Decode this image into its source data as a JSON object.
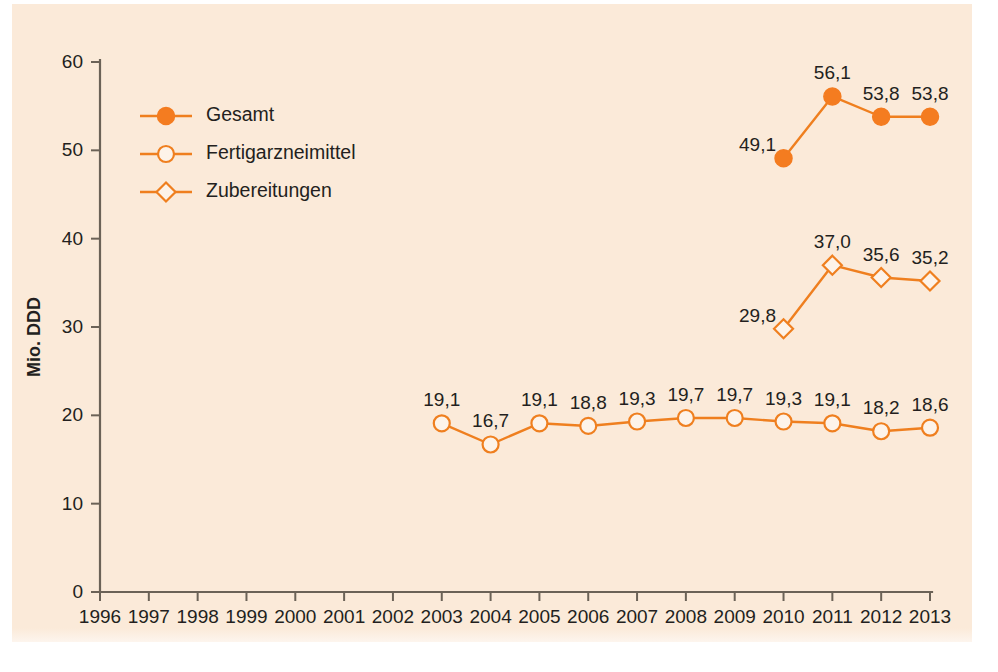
{
  "chart_data": {
    "type": "line",
    "title": "",
    "xlabel": "",
    "ylabel": "Mio. DDD",
    "x": [
      1996,
      1997,
      1998,
      1999,
      2000,
      2001,
      2002,
      2003,
      2004,
      2005,
      2006,
      2007,
      2008,
      2009,
      2010,
      2011,
      2012,
      2013
    ],
    "xtick_labels": [
      "1996",
      "1997",
      "1998",
      "1999",
      "2000",
      "2001",
      "2002",
      "2003",
      "2004",
      "2005",
      "2006",
      "2007",
      "2008",
      "2009",
      "2010",
      "2011",
      "2012",
      "2013"
    ],
    "ylim": [
      0,
      60
    ],
    "yticks": [
      0,
      10,
      20,
      30,
      40,
      50,
      60
    ],
    "ytick_labels": [
      "0",
      "10",
      "20",
      "30",
      "40",
      "50",
      "60"
    ],
    "grid": false,
    "legend_position": "upper-left-inside",
    "accent_color": "#ef7f1f",
    "background_color": "#fbead9",
    "series": [
      {
        "name": "Gesamt",
        "marker": "filled-circle",
        "color": "#f47c20",
        "x": [
          2010,
          2011,
          2012,
          2013
        ],
        "values": [
          49.1,
          56.1,
          53.8,
          53.8
        ],
        "labels": [
          "49,1",
          "56,1",
          "53,8",
          "53,8"
        ],
        "label_positions": [
          "left",
          "above",
          "above",
          "above"
        ]
      },
      {
        "name": "Fertigarzneimittel",
        "marker": "open-circle",
        "color": "#ef7f1f",
        "x": [
          2003,
          2004,
          2005,
          2006,
          2007,
          2008,
          2009,
          2010,
          2011,
          2012,
          2013
        ],
        "values": [
          19.1,
          16.7,
          19.1,
          18.8,
          19.3,
          19.7,
          19.7,
          19.3,
          19.1,
          18.2,
          18.6
        ],
        "labels": [
          "19,1",
          "16,7",
          "19,1",
          "18,8",
          "19,3",
          "19,7",
          "19,7",
          "19,3",
          "19,1",
          "18,2",
          "18,6"
        ],
        "label_positions": [
          "above",
          "above",
          "above",
          "above",
          "above",
          "above",
          "above",
          "above",
          "above",
          "above",
          "above"
        ]
      },
      {
        "name": "Zubereitungen",
        "marker": "open-diamond",
        "color": "#ef7f1f",
        "x": [
          2010,
          2011,
          2012,
          2013
        ],
        "values": [
          29.8,
          37.0,
          35.6,
          35.2
        ],
        "labels": [
          "29,8",
          "37,0",
          "35,6",
          "35,2"
        ],
        "label_positions": [
          "left",
          "above",
          "above",
          "above"
        ]
      }
    ]
  },
  "legend": {
    "entries": [
      {
        "label": "Gesamt",
        "marker": "filled-circle"
      },
      {
        "label": "Fertigarzneimittel",
        "marker": "open-circle"
      },
      {
        "label": "Zubereitungen",
        "marker": "open-diamond"
      }
    ]
  }
}
